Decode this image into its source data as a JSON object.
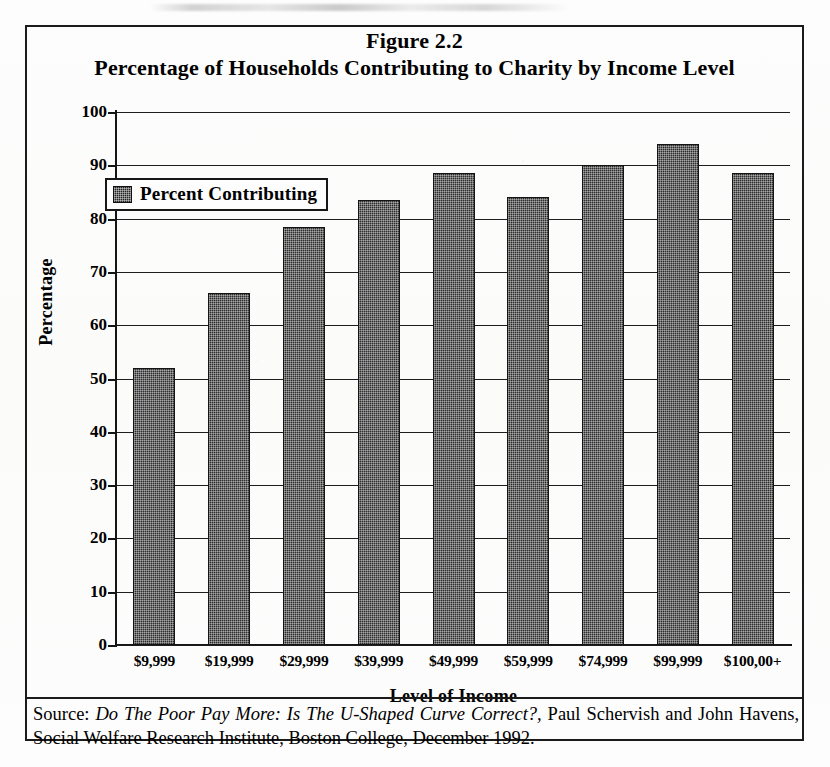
{
  "figure": {
    "title_line1": "Figure 2.2",
    "title_line2": "Percentage of Households Contributing to Charity by Income Level",
    "source_prefix": "Source: ",
    "source_title": "Do The Poor Pay More: Is The U-Shaped Curve Correct?,",
    "source_rest": " Paul Schervish and John Havens, Social Welfare Research Institute, Boston College, December 1992."
  },
  "legend": {
    "entries": [
      {
        "label": "Percent Contributing",
        "swatch": "dark-dithered-square"
      }
    ],
    "position": "inside-top-left"
  },
  "chart_data": {
    "type": "bar",
    "title": "Percentage of Households Contributing to Charity by Income Level",
    "subtitle": "Figure 2.2",
    "xlabel": "Level of Income",
    "ylabel": "Percentage",
    "categories": [
      "$9,999",
      "$19,999",
      "$29,999",
      "$39,999",
      "$49,999",
      "$59,999",
      "$74,999",
      "$99,999",
      "$100,00+"
    ],
    "series": [
      {
        "name": "Percent Contributing",
        "values": [
          52,
          66,
          78.5,
          83.5,
          88.5,
          84,
          90,
          94,
          88.5
        ]
      }
    ],
    "values": [
      52,
      66,
      78.5,
      83.5,
      88.5,
      84,
      90,
      94,
      88.5
    ],
    "ylim": [
      0,
      100
    ],
    "ytick_labels": [
      "100",
      "90",
      "80",
      "70",
      "60",
      "50",
      "40",
      "30",
      "20",
      "10",
      "0"
    ],
    "ytick_values": [
      100,
      90,
      80,
      70,
      60,
      50,
      40,
      30,
      20,
      10,
      0
    ],
    "ytick_step": 10,
    "grid": true,
    "grid_axis": "y",
    "legend_position": "upper left",
    "bar_color": "#2b2b2b",
    "axis_color": "#151515",
    "background_color": "#ffffff"
  }
}
